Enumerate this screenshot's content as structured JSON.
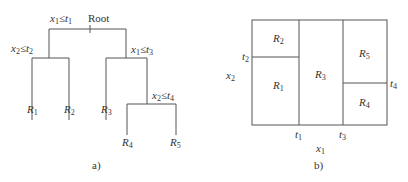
{
  "panel_a": {
    "caption": "a)",
    "root_label": "Root",
    "splits": {
      "root": {
        "var": "x",
        "var_sub": "1",
        "op": "≤",
        "thr": "t",
        "thr_sub": "1"
      },
      "left": {
        "var": "x",
        "var_sub": "2",
        "op": "≤",
        "thr": "t",
        "thr_sub": "2"
      },
      "right": {
        "var": "x",
        "var_sub": "1",
        "op": "≤",
        "thr": "t",
        "thr_sub": "3"
      },
      "right_right": {
        "var": "x",
        "var_sub": "2",
        "op": "≤",
        "thr": "t",
        "thr_sub": "4"
      }
    },
    "leaves": [
      {
        "name": "R",
        "sub": "1"
      },
      {
        "name": "R",
        "sub": "2"
      },
      {
        "name": "R",
        "sub": "3"
      },
      {
        "name": "R",
        "sub": "4"
      },
      {
        "name": "R",
        "sub": "5"
      }
    ]
  },
  "panel_b": {
    "caption": "b)",
    "x_axis": {
      "name": "x",
      "sub": "1"
    },
    "y_axis": {
      "name": "x",
      "sub": "2"
    },
    "ticks": {
      "t1": {
        "name": "t",
        "sub": "1"
      },
      "t2": {
        "name": "t",
        "sub": "2"
      },
      "t3": {
        "name": "t",
        "sub": "3"
      },
      "t4": {
        "name": "t",
        "sub": "4"
      }
    },
    "regions": [
      {
        "name": "R",
        "sub": "1"
      },
      {
        "name": "R",
        "sub": "2"
      },
      {
        "name": "R",
        "sub": "3"
      },
      {
        "name": "R",
        "sub": "4"
      },
      {
        "name": "R",
        "sub": "5"
      }
    ]
  }
}
